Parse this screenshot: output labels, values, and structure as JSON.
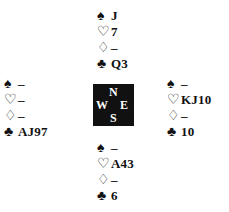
{
  "compass": {
    "north": "N",
    "south": "S",
    "west": "W",
    "east": "E"
  },
  "suits": {
    "spades": "♠",
    "hearts": "♡",
    "diamonds": "♢",
    "clubs": "♣"
  },
  "hands": {
    "north": {
      "spades": "J",
      "hearts": "7",
      "diamonds": "–",
      "clubs": "Q3"
    },
    "west": {
      "spades": "–",
      "hearts": "–",
      "diamonds": "–",
      "clubs": "AJ97"
    },
    "east": {
      "spades": "–",
      "hearts": "KJ10",
      "diamonds": "–",
      "clubs": "10"
    },
    "south": {
      "spades": "–",
      "hearts": "A43",
      "diamonds": "–",
      "clubs": "6"
    }
  }
}
